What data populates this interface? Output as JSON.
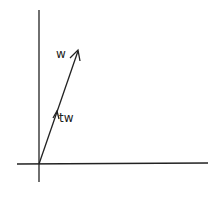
{
  "diagram": {
    "title": "",
    "axes": {
      "x_axis": true,
      "y_axis": true
    },
    "vectors": [
      {
        "name": "w",
        "label": "w",
        "from": [
          39,
          164
        ],
        "to": [
          78,
          50
        ]
      },
      {
        "name": "tw",
        "label": "tw",
        "from": [
          39,
          164
        ],
        "to": [
          57,
          111
        ]
      }
    ],
    "colors": {
      "ink": "#222222",
      "background": "#ffffff"
    }
  }
}
